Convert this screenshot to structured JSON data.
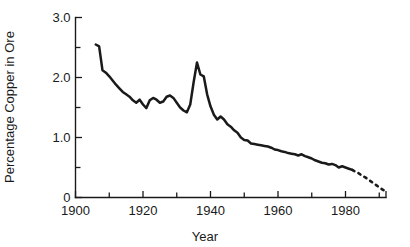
{
  "chart_data": {
    "type": "line",
    "title": "",
    "xlabel": "Year",
    "ylabel": "Percentage Copper in Ore",
    "xlim": [
      1900,
      1992
    ],
    "ylim": [
      0,
      3.0
    ],
    "grid": false,
    "legend": null,
    "x_ticks_major": [
      1900,
      1920,
      1940,
      1960,
      1980
    ],
    "x_tick_labels": [
      "1900",
      "1920",
      "1940",
      "1960",
      "1980"
    ],
    "x_ticks_minor": [
      1910,
      1930,
      1950,
      1970,
      1990
    ],
    "y_ticks_major": [
      0,
      1.0,
      2.0,
      3.0
    ],
    "y_tick_labels": [
      "0",
      "1.0",
      "2.0",
      "3.0"
    ],
    "y_ticks_minor": [
      0.5,
      1.5,
      2.5
    ],
    "series": [
      {
        "name": "Percentage copper in ore (historical)",
        "style": "solid",
        "x": [
          1906,
          1907,
          1908,
          1909,
          1910,
          1911,
          1912,
          1913,
          1914,
          1915,
          1916,
          1917,
          1918,
          1919,
          1920,
          1921,
          1922,
          1923,
          1924,
          1925,
          1926,
          1927,
          1928,
          1929,
          1930,
          1931,
          1932,
          1933,
          1934,
          1935,
          1936,
          1937,
          1938,
          1939,
          1940,
          1941,
          1942,
          1943,
          1944,
          1945,
          1946,
          1947,
          1948,
          1949,
          1950,
          1951,
          1952,
          1953,
          1954,
          1955,
          1956,
          1957,
          1958,
          1959,
          1960,
          1961,
          1962,
          1963,
          1964,
          1965,
          1966,
          1967,
          1968,
          1969,
          1970,
          1971,
          1972,
          1973,
          1974,
          1975,
          1976,
          1977,
          1978,
          1979,
          1980,
          1981,
          1982
        ],
        "y": [
          2.55,
          2.52,
          2.12,
          2.08,
          2.02,
          1.95,
          1.88,
          1.82,
          1.76,
          1.72,
          1.68,
          1.62,
          1.58,
          1.63,
          1.55,
          1.49,
          1.62,
          1.66,
          1.63,
          1.58,
          1.6,
          1.68,
          1.7,
          1.66,
          1.58,
          1.5,
          1.45,
          1.42,
          1.55,
          1.92,
          2.25,
          2.05,
          2.02,
          1.72,
          1.52,
          1.38,
          1.3,
          1.35,
          1.3,
          1.22,
          1.18,
          1.12,
          1.08,
          1.0,
          0.96,
          0.95,
          0.9,
          0.89,
          0.88,
          0.87,
          0.86,
          0.85,
          0.83,
          0.8,
          0.79,
          0.77,
          0.76,
          0.74,
          0.73,
          0.72,
          0.7,
          0.72,
          0.69,
          0.67,
          0.65,
          0.62,
          0.6,
          0.58,
          0.57,
          0.55,
          0.56,
          0.54,
          0.5,
          0.52,
          0.5,
          0.48,
          0.46
        ]
      },
      {
        "name": "Percentage copper in ore (projected)",
        "style": "dashed",
        "x": [
          1982,
          1983,
          1984,
          1985,
          1986,
          1987,
          1988,
          1989,
          1990,
          1991,
          1992
        ],
        "y": [
          0.46,
          0.43,
          0.4,
          0.36,
          0.33,
          0.29,
          0.25,
          0.21,
          0.17,
          0.13,
          0.1
        ]
      }
    ],
    "colors": {
      "line": "#1a1a1a",
      "axis": "#1a1a1a",
      "background": "#ffffff"
    }
  }
}
